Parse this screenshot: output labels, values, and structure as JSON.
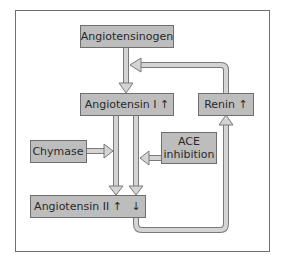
{
  "diagram": {
    "nodes": {
      "angiotensinogen": "Angiotensinogen",
      "angiotensin_i": "Angiotensin I ↑",
      "renin": "Renin ↑",
      "chymase": "Chymase",
      "ace_inhibition_line1": "ACE",
      "ace_inhibition_line2": "inhibition",
      "angiotensin_ii": "Angiotensin II ↑",
      "angiotensin_ii_down": "↓"
    },
    "edges": [
      {
        "from": "Angiotensinogen",
        "to": "Angiotensin I"
      },
      {
        "from": "Renin",
        "to": "Angiotensinogen → Angiotensin I pathway"
      },
      {
        "from": "Angiotensin I",
        "to": "Angiotensin II",
        "via": "Chymase"
      },
      {
        "from": "Angiotensin I",
        "to": "Angiotensin II",
        "via": "ACE (inhibited)"
      },
      {
        "from": "Angiotensin II",
        "to": "Renin",
        "type": "feedback"
      }
    ],
    "colors": {
      "box_fill": "#bdbdbd",
      "box_stroke": "#6f6f6f",
      "arrow_fill": "#d4d4d4",
      "frame": "#6f6f6f"
    }
  }
}
